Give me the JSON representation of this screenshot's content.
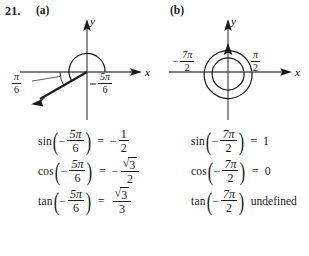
{
  "problem": {
    "number": "21.",
    "part_a_label": "(a)",
    "part_b_label": "(b)"
  },
  "diagram_a": {
    "axis_x_label": "x",
    "axis_y_label": "y",
    "angle_main": {
      "minus": "−",
      "numerator": "5π",
      "denominator": "6"
    },
    "angle_reference": {
      "numerator": "π",
      "denominator": "6"
    },
    "terminal_ray_quadrant": "III",
    "rotation_direction": "clockwise"
  },
  "diagram_b": {
    "axis_x_label": "x",
    "axis_y_label": "y",
    "angle_main": {
      "minus": "−",
      "numerator": "7π",
      "denominator": "2"
    },
    "angle_reference": {
      "numerator": "π",
      "denominator": "2"
    },
    "terminal_ray_direction": "positive y-axis",
    "rotation_direction": "clockwise",
    "loops": 2
  },
  "equations_a": [
    {
      "function": "sin",
      "arg_minus": "−",
      "arg_num": "5π",
      "arg_den": "6",
      "relation": "=",
      "result_minus": "−",
      "result_num": "1",
      "result_den": "2",
      "result_radical": false
    },
    {
      "function": "cos",
      "arg_minus": "−",
      "arg_num": "5π",
      "arg_den": "6",
      "relation": "=",
      "result_minus": "−",
      "result_num": "3",
      "result_den": "2",
      "result_radical": true
    },
    {
      "function": "tan",
      "arg_minus": "−",
      "arg_num": "5π",
      "arg_den": "6",
      "relation": "=",
      "result_minus": "",
      "result_num": "3",
      "result_den": "3",
      "result_radical": true
    }
  ],
  "equations_b": [
    {
      "function": "sin",
      "arg_minus": "−",
      "arg_num": "7π",
      "arg_den": "2",
      "relation": "=",
      "result_value": "1"
    },
    {
      "function": "cos",
      "arg_minus": "−",
      "arg_num": "7π",
      "arg_den": "2",
      "relation": "=",
      "result_value": "0"
    },
    {
      "function": "tan",
      "arg_minus": "−",
      "arg_num": "7π",
      "arg_den": "2",
      "relation": "",
      "result_value": "undefined"
    }
  ],
  "colors": {
    "ink": "#1a1a1a",
    "background": "#ffffff"
  }
}
